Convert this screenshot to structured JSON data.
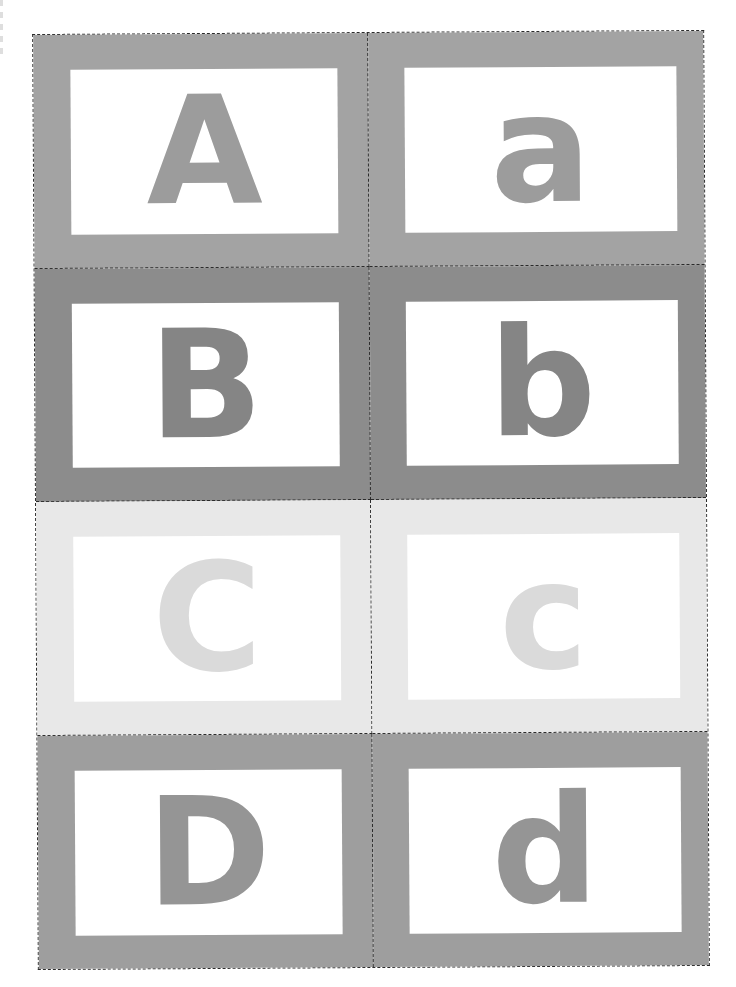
{
  "worksheet": {
    "title": "Alphabet flash cards",
    "cut_line_style": "dashed",
    "cut_line_color": "#2a2a2a",
    "rows": [
      {
        "frame_color": "#a3a3a3",
        "letter_color": "#9c9c9c",
        "cards": [
          {
            "letter": "A",
            "case": "upper"
          },
          {
            "letter": "a",
            "case": "lower"
          }
        ]
      },
      {
        "frame_color": "#8c8c8c",
        "letter_color": "#858585",
        "cards": [
          {
            "letter": "B",
            "case": "upper"
          },
          {
            "letter": "b",
            "case": "lower"
          }
        ]
      },
      {
        "frame_color": "#e8e8e8",
        "letter_color": "#dadada",
        "cards": [
          {
            "letter": "C",
            "case": "upper"
          },
          {
            "letter": "c",
            "case": "lower"
          }
        ]
      },
      {
        "frame_color": "#9e9e9e",
        "letter_color": "#959595",
        "cards": [
          {
            "letter": "D",
            "case": "upper"
          },
          {
            "letter": "d",
            "case": "lower"
          }
        ]
      }
    ]
  }
}
